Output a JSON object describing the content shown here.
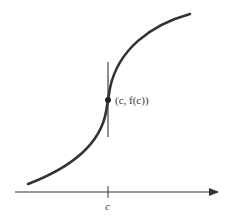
{
  "diagram": {
    "point_label": "(c, f(c))",
    "x_tick_label": "c",
    "colors": {
      "curve": "#333333",
      "axis": "#333333",
      "tangent": "#444444"
    }
  }
}
